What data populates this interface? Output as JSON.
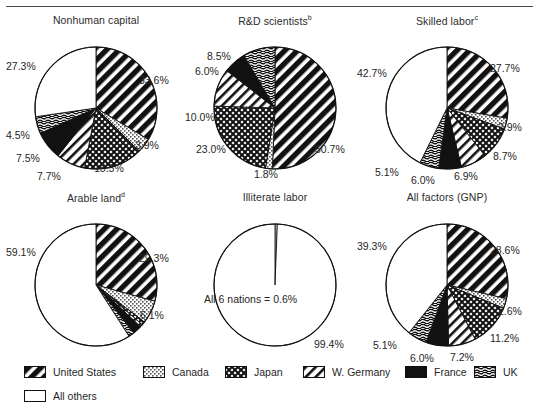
{
  "figure": {
    "note_marker_rd": "b",
    "note_marker_skilled": "c",
    "note_marker_arable": "d"
  },
  "legend": {
    "items": [
      {
        "label": "United States",
        "pattern": "diag-thick-black",
        "x": 24,
        "y": 8
      },
      {
        "label": "Canada",
        "pattern": "dots-light",
        "x": 143,
        "y": 8
      },
      {
        "label": "Japan",
        "pattern": "crosshatch",
        "x": 225,
        "y": 8
      },
      {
        "label": "W. Germany",
        "pattern": "diag-thin",
        "x": 303,
        "y": 8
      },
      {
        "label": "France",
        "pattern": "solid-black",
        "x": 405,
        "y": 8
      },
      {
        "label": "UK",
        "pattern": "horiz-wave",
        "x": 474,
        "y": 8
      },
      {
        "label": "All others",
        "pattern": "white",
        "x": 24,
        "y": 32
      }
    ]
  },
  "chart_data": [
    {
      "type": "pie",
      "title": "Nonhuman capital",
      "categories": [
        "United States",
        "Canada",
        "Japan",
        "W. Germany",
        "France",
        "UK",
        "All others"
      ],
      "values": [
        33.6,
        3.9,
        15.5,
        7.7,
        7.5,
        4.5,
        27.3
      ],
      "value_labels": [
        "33.6%",
        "3.9%",
        "15.5%",
        "7.7%",
        "7.5%",
        "4.5%",
        "27.3%"
      ],
      "patterns": [
        "diag-thick-black",
        "dots-light",
        "crosshatch",
        "diag-thin",
        "solid-black",
        "horiz-wave",
        "white"
      ],
      "label_positions": [
        {
          "x": 133,
          "y": 43,
          "anchor": "start"
        },
        {
          "x": 129,
          "y": 108,
          "anchor": "start"
        },
        {
          "x": 88,
          "y": 131,
          "anchor": "start"
        },
        {
          "x": 31,
          "y": 139,
          "anchor": "start"
        },
        {
          "x": 10,
          "y": 121,
          "anchor": "start"
        },
        {
          "x": 0,
          "y": 98,
          "anchor": "start"
        },
        {
          "x": 0,
          "y": 29,
          "anchor": "start"
        }
      ]
    },
    {
      "type": "pie",
      "title": "R&D scientists",
      "categories": [
        "United States",
        "Canada",
        "Japan",
        "W. Germany",
        "France",
        "UK",
        "All others"
      ],
      "values": [
        50.7,
        1.8,
        23.0,
        10.0,
        6.0,
        8.5,
        0.0
      ],
      "value_labels": [
        "50.7%",
        "1.8%",
        "23.0%",
        "10.0%",
        "6.0%",
        "8.5%",
        ""
      ],
      "patterns": [
        "diag-thick-black",
        "dots-light",
        "crosshatch",
        "diag-thin",
        "solid-black",
        "horiz-wave",
        "white"
      ],
      "label_positions": [
        {
          "x": 130,
          "y": 112,
          "anchor": "start"
        },
        {
          "x": 69,
          "y": 137,
          "anchor": "start"
        },
        {
          "x": 11,
          "y": 112,
          "anchor": "start"
        },
        {
          "x": 0,
          "y": 80,
          "anchor": "start"
        },
        {
          "x": 10,
          "y": 34,
          "anchor": "start"
        },
        {
          "x": 22,
          "y": 19,
          "anchor": "start"
        }
      ]
    },
    {
      "type": "pie",
      "title": "Skilled labor",
      "categories": [
        "United States",
        "Canada",
        "Japan",
        "W. Germany",
        "France",
        "UK",
        "All others"
      ],
      "values": [
        27.7,
        2.9,
        8.7,
        6.9,
        6.0,
        5.1,
        42.7
      ],
      "value_labels": [
        "27.7%",
        "2.9%",
        "8.7%",
        "6.9%",
        "6.0%",
        "5.1%",
        "42.7%"
      ],
      "patterns": [
        "diag-thick-black",
        "dots-light",
        "crosshatch",
        "diag-thin",
        "solid-black",
        "horiz-wave",
        "white"
      ],
      "label_positions": [
        {
          "x": 133,
          "y": 31,
          "anchor": "start"
        },
        {
          "x": 141,
          "y": 90,
          "anchor": "start"
        },
        {
          "x": 136,
          "y": 119,
          "anchor": "start"
        },
        {
          "x": 97,
          "y": 139,
          "anchor": "start"
        },
        {
          "x": 54,
          "y": 143,
          "anchor": "start"
        },
        {
          "x": 18,
          "y": 135,
          "anchor": "start"
        },
        {
          "x": 0,
          "y": 36,
          "anchor": "start"
        }
      ]
    },
    {
      "type": "pie",
      "title": "Arable land",
      "categories": [
        "United States",
        "Canada",
        "Japan",
        "W. Germany",
        "France",
        "UK",
        "All others"
      ],
      "values": [
        29.3,
        6.1,
        0.9,
        0.7,
        2.4,
        1.5,
        59.1
      ],
      "value_labels": [
        "29.3%",
        "6.1%",
        "",
        "",
        "",
        "",
        "59.1%"
      ],
      "patterns": [
        "diag-thick-black",
        "dots-light",
        "crosshatch",
        "diag-thin",
        "solid-black",
        "horiz-wave",
        "white"
      ],
      "label_positions": [
        {
          "x": 133,
          "y": 44,
          "anchor": "start"
        },
        {
          "x": 134,
          "y": 101,
          "anchor": "start"
        },
        {
          "x": 0,
          "y": 0,
          "anchor": "start"
        },
        {
          "x": 0,
          "y": 0,
          "anchor": "start"
        },
        {
          "x": 0,
          "y": 0,
          "anchor": "start"
        },
        {
          "x": 0,
          "y": 0,
          "anchor": "start"
        },
        {
          "x": 0,
          "y": 38,
          "anchor": "start"
        }
      ]
    },
    {
      "type": "pie",
      "title": "Illiterate labor",
      "categories": [
        "All 6 nations",
        "All others"
      ],
      "values": [
        0.6,
        99.4
      ],
      "value_labels": [
        "",
        "99.4%"
      ],
      "patterns": [
        "white",
        "white"
      ],
      "center_note": "All 6 nations  =  0.6%",
      "label_positions": [
        {
          "x": 0,
          "y": 0,
          "anchor": "start"
        },
        {
          "x": 129,
          "y": 130,
          "anchor": "start"
        }
      ]
    },
    {
      "type": "pie",
      "title": "All factors (GNP)",
      "categories": [
        "United States",
        "Canada",
        "Japan",
        "W. Germany",
        "France",
        "UK",
        "All others"
      ],
      "values": [
        28.6,
        2.6,
        11.2,
        7.2,
        6.0,
        5.1,
        39.3
      ],
      "value_labels": [
        "28.6%",
        "2.6%",
        "11.2%",
        "7.2%",
        "6.0%",
        "5.1%",
        "39.3%"
      ],
      "patterns": [
        "diag-thick-black",
        "dots-light",
        "crosshatch",
        "diag-thin",
        "solid-black",
        "horiz-wave",
        "white"
      ],
      "label_positions": [
        {
          "x": 133,
          "y": 36,
          "anchor": "start"
        },
        {
          "x": 141,
          "y": 97,
          "anchor": "start"
        },
        {
          "x": 133,
          "y": 124,
          "anchor": "start"
        },
        {
          "x": 93,
          "y": 143,
          "anchor": "start"
        },
        {
          "x": 53,
          "y": 144,
          "anchor": "start"
        },
        {
          "x": 16,
          "y": 131,
          "anchor": "start"
        },
        {
          "x": 0,
          "y": 32,
          "anchor": "start"
        }
      ]
    }
  ]
}
